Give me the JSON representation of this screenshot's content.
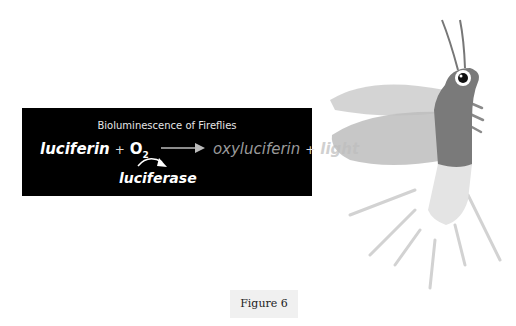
{
  "equation": {
    "title": "Bioluminescence of Fireflies",
    "reactant1": "luciferin",
    "plus1": "+",
    "reactant2": "O",
    "reactant2_sub": "2",
    "product1": "oxyluciferin",
    "plus2": "+",
    "product2": "light",
    "enzyme": "luciferase"
  },
  "figure": {
    "label": "Figure 6"
  },
  "illustration": {
    "subject": "firefly",
    "colors": {
      "body": "#7a7a7a",
      "wings": "#c8c8c8",
      "lantern": "#e4e4e4",
      "rays": "#cfcfcf"
    }
  }
}
